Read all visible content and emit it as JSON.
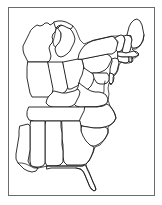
{
  "figure": {
    "type": "line-art-map",
    "width": 162,
    "height": 205,
    "background_color": "#ffffff",
    "outline_color": "#1a1a1a",
    "frame_color": "#6b6b6b",
    "fill_color": "#ffffff",
    "has_labels": false,
    "has_legend": false,
    "has_title_text": false
  },
  "frame": {
    "x": 8,
    "y": 7,
    "width": 147,
    "height": 189,
    "stroke": "#6b6b6b",
    "stroke_width": 1
  },
  "map": {
    "projection_region": "Eastern United States",
    "coastlines": [
      "Atlantic Ocean",
      "Gulf of Mexico",
      "Great Lakes"
    ],
    "states": [
      {
        "name": "Wisconsin",
        "abbr": "WI"
      },
      {
        "name": "Michigan",
        "abbr": "MI"
      },
      {
        "name": "Illinois",
        "abbr": "IL"
      },
      {
        "name": "Indiana",
        "abbr": "IN"
      },
      {
        "name": "Ohio",
        "abbr": "OH"
      },
      {
        "name": "Pennsylvania",
        "abbr": "PA"
      },
      {
        "name": "New York",
        "abbr": "NY"
      },
      {
        "name": "Vermont",
        "abbr": "VT"
      },
      {
        "name": "New Hampshire",
        "abbr": "NH"
      },
      {
        "name": "Maine",
        "abbr": "ME"
      },
      {
        "name": "Massachusetts",
        "abbr": "MA"
      },
      {
        "name": "Connecticut",
        "abbr": "CT"
      },
      {
        "name": "Rhode Island",
        "abbr": "RI"
      },
      {
        "name": "New Jersey",
        "abbr": "NJ"
      },
      {
        "name": "Delaware",
        "abbr": "DE"
      },
      {
        "name": "Maryland",
        "abbr": "MD"
      },
      {
        "name": "West Virginia",
        "abbr": "WV"
      },
      {
        "name": "Virginia",
        "abbr": "VA"
      },
      {
        "name": "Kentucky",
        "abbr": "KY"
      },
      {
        "name": "Tennessee",
        "abbr": "TN"
      },
      {
        "name": "North Carolina",
        "abbr": "NC"
      },
      {
        "name": "South Carolina",
        "abbr": "SC"
      },
      {
        "name": "Georgia",
        "abbr": "GA"
      },
      {
        "name": "Florida",
        "abbr": "FL"
      },
      {
        "name": "Alabama",
        "abbr": "AL"
      },
      {
        "name": "Mississippi",
        "abbr": "MS"
      },
      {
        "name": "Louisiana",
        "abbr": "LA"
      }
    ],
    "water_bodies": [
      {
        "name": "Lake Michigan"
      },
      {
        "name": "Chesapeake Bay"
      }
    ]
  },
  "geometry": {
    "landmass_outline": "M 36 34 L 34 30 L 31 30 L 29 33 L 25 35 L 22 39 L 20 45 L 21 52 L 19 58 L 20 64 L 19 70 L 21 76 L 20 82 L 22 88 L 24 95 L 23 102 L 22 110 L 21 118 L 20 126 L 19 134 L 18 142 L 17 150 L 16 158 L 15 163 L 18 167 L 22 170 L 27 172 L 31 174 L 35 175 L 38 174 L 40 171 L 43 173 L 47 174 L 52 173 L 56 171 L 60 169 L 64 167 L 68 166 L 72 165 L 76 164 L 79 163 L 82 164 L 84 168 L 86 173 L 88 178 L 90 183 L 92 187 L 94 190 L 97 189 L 99 185 L 100 180 L 101 174 L 100 168 L 99 162 L 98 156 L 97 150 L 99 146 L 103 143 L 107 140 L 110 136 L 112 131 L 114 126 L 116 121 L 118 117 L 119 113 L 118 109 L 117 105 L 119 101 L 122 98 L 124 94 L 125 90 L 124 86 L 122 83 L 124 80 L 127 78 L 129 75 L 130 71 L 131 67 L 133 63 L 136 60 L 139 56 L 142 52 L 144 47 L 145 42 L 144 37 L 142 33 L 140 29 L 138 25 L 135 22 L 132 20 L 129 19 L 127 21 L 126 25 L 125 29 L 123 33 L 120 36 L 117 38 L 114 39 L 111 38 L 108 36 L 105 35 L 102 36 L 99 38 L 96 39 L 93 38 L 90 36 L 87 34 L 84 33 L 81 33 L 78 35 L 75 37 L 72 38 L 69 37 L 66 35 L 63 33 L 60 31 L 57 30 L 54 31 L 51 33 L 48 35 L 45 36 L 42 35 L 39 34 Z",
    "note": "Simplified vector approximation of the eastern US coastline and northern border"
  }
}
